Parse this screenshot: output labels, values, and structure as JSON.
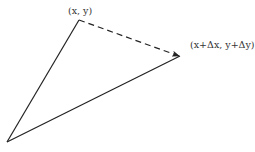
{
  "diagram": {
    "labels": {
      "top_vertex": "(x, y)",
      "right_vertex": "(x+Δx, y+Δy)"
    },
    "vertices": {
      "origin": [
        7,
        142
      ],
      "top": [
        79,
        20
      ],
      "right": [
        180,
        56
      ]
    },
    "edges": [
      {
        "from": "origin",
        "to": "top",
        "style": "solid"
      },
      {
        "from": "origin",
        "to": "right",
        "style": "solid"
      },
      {
        "from": "top",
        "to": "right",
        "style": "dashed",
        "arrow": "end"
      }
    ],
    "colors": {
      "line": "#222222",
      "text": "#333333",
      "background": "#ffffff"
    }
  }
}
